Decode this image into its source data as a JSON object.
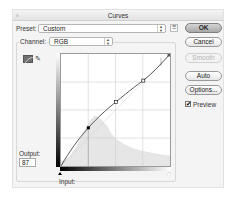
{
  "window": {
    "title": "Curves"
  },
  "preset": {
    "label": "Preset:",
    "value": "Custom",
    "options_icon": "preset-options-icon"
  },
  "channel": {
    "label": "Channel:",
    "value": "RGB"
  },
  "buttons": {
    "ok": "OK",
    "cancel": "Cancel",
    "smooth": "Smooth",
    "auto": "Auto",
    "options": "Options..."
  },
  "preview": {
    "label": "Preview",
    "checked": true,
    "check_glyph": "✔"
  },
  "tools": {
    "curve_tool": "curve-point-tool",
    "pencil_tool": "pencil-tool",
    "pencil_glyph": "✎"
  },
  "output": {
    "label": "Output:",
    "value": "87"
  },
  "input": {
    "label": "Input:"
  },
  "curve": {
    "points": [
      {
        "input": 0,
        "output": 0
      },
      {
        "input": 64,
        "output": 87
      },
      {
        "input": 128,
        "output": 146
      },
      {
        "input": 192,
        "output": 204
      },
      {
        "input": 255,
        "output": 255
      }
    ],
    "selected_point_index": 1
  },
  "colors": {
    "ok_button_fill": "#b8b8b8",
    "window_bg": "#f4f4f4",
    "histogram": "#e6e6e6"
  }
}
